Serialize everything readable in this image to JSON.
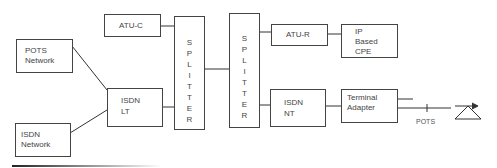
{
  "diagram": {
    "type": "network-block-diagram",
    "nodes": {
      "atu_c": {
        "label": "ATU-C"
      },
      "pots_network": {
        "line1": "POTS",
        "line2": "Network"
      },
      "isdn_network": {
        "line1": "ISDN",
        "line2": "Network"
      },
      "isdn_lt": {
        "line1": "ISDN",
        "line2": "LT"
      },
      "splitter_1": {
        "label": "SPLITTER"
      },
      "splitter_2": {
        "label": "SPLITTER"
      },
      "atu_r": {
        "label": "ATU-R"
      },
      "ip_cpe": {
        "line1": "IP",
        "line2": "Based",
        "line3": "CPE"
      },
      "isdn_nt": {
        "line1": "ISDN",
        "line2": "NT"
      },
      "terminal_adapter": {
        "line1": "Terminal",
        "line2": "Adapter"
      }
    },
    "pots_label": "POTS",
    "edges": [
      [
        "POTS Network",
        "ISDN LT"
      ],
      [
        "ISDN Network",
        "ISDN LT"
      ],
      [
        "ATU-C",
        "Splitter 1"
      ],
      [
        "ISDN LT",
        "Splitter 1"
      ],
      [
        "Splitter 1",
        "Splitter 2"
      ],
      [
        "Splitter 2",
        "ATU-R"
      ],
      [
        "ATU-R",
        "IP Based CPE"
      ],
      [
        "Splitter 2",
        "ISDN NT"
      ],
      [
        "ISDN NT",
        "Terminal Adapter"
      ],
      [
        "Terminal Adapter",
        "POTS phone"
      ]
    ]
  }
}
